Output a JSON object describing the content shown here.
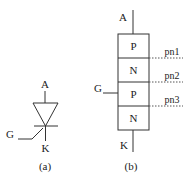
{
  "figure_a": {
    "anode_label": "A",
    "gate_label": "G",
    "cathode_label": "K",
    "caption": "(a)"
  },
  "figure_b": {
    "anode_label": "A",
    "gate_label": "G",
    "cathode_label": "K",
    "caption": "(b)",
    "layers": [
      "P",
      "N",
      "P",
      "N"
    ],
    "junctions": [
      "pn1",
      "pn2",
      "pn3"
    ]
  }
}
